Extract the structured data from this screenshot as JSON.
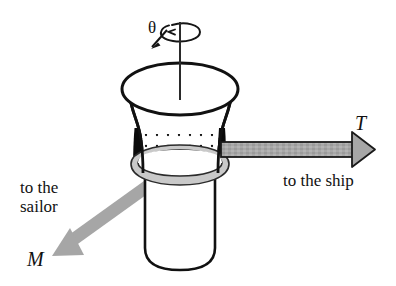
{
  "figure": {
    "background_color": "#ffffff",
    "width": 396,
    "height": 286
  },
  "labels": {
    "tension_symbol": "T",
    "moment_symbol": "M",
    "angle_symbol": "θ",
    "to_ship": "to the ship",
    "to_sailor": "to the\nsailor"
  },
  "colors": {
    "outline": "#111111",
    "arrow_fill": "#a6a6a6",
    "arrow_outline": "#1a1a1a",
    "rope_band_fill": "#c9c9c9",
    "rope_band_outline": "#2b2b2b",
    "body_fill": "#ffffff",
    "shadow_black": "#000000",
    "stipple_dot": "#111111"
  },
  "elements": {
    "capstan_top_ellipse": "top drum rim, wide ellipse",
    "capstan_waist": "concave hourglass barrel",
    "capstan_base": "lower cylinder with rounded bottom",
    "rope_coil_band": "gray elliptical band around waist",
    "stipple_region": "dotted texture on barrel above rope",
    "rotation_axis": "vertical shaft line through center",
    "rotation_arrow": "curved ellipse arrow indicating spin"
  },
  "arrows": [
    {
      "name": "tension-arrow",
      "symbol": "T",
      "caption": "to the ship",
      "direction": "right",
      "style": "gray fill with black outline"
    },
    {
      "name": "sailor-force-arrow",
      "symbol": "M",
      "caption": "to the sailor",
      "direction": "down-left",
      "style": "solid gray, no outline"
    }
  ]
}
